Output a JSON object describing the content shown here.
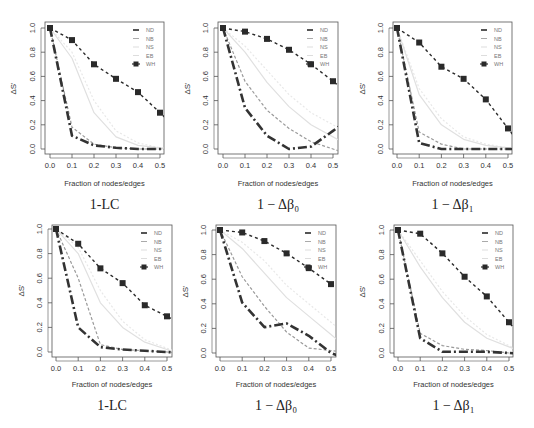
{
  "figure": {
    "legend_labels": [
      "ND",
      "NB",
      "NS",
      "EB",
      "WH"
    ],
    "xlabel": "Fraction of nodes/edges",
    "ylabel": "ΔS'",
    "x_ticks": [
      "0.0",
      "0.1",
      "0.2",
      "0.3",
      "0.4",
      "0.5"
    ],
    "y_ticks": [
      "0.0",
      "0.2",
      "0.4",
      "0.6",
      "0.8",
      "1.0"
    ],
    "colors": {
      "ND": "#333333",
      "NB": "#9a9a9a",
      "NS": "#e0e0e0",
      "EB": "#e8e8e8",
      "WH": "#2a2a2a",
      "axis": "#555555",
      "text": "#333333"
    }
  },
  "chart_data": [
    {
      "type": "line",
      "caption": "1-LC",
      "title": "",
      "xlabel": "Fraction of nodes/edges",
      "ylabel": "ΔS'",
      "x": [
        0.0,
        0.1,
        0.2,
        0.3,
        0.4,
        0.5
      ],
      "xlim": [
        0,
        0.52
      ],
      "ylim": [
        0,
        1.0
      ],
      "grid": false,
      "legend_position": "top-right",
      "series": [
        {
          "name": "ND",
          "values": [
            1.0,
            0.11,
            0.03,
            0.01,
            0.0,
            0.0
          ]
        },
        {
          "name": "NB",
          "values": [
            1.0,
            0.18,
            0.04,
            0.01,
            0.0,
            0.0
          ]
        },
        {
          "name": "NS",
          "values": [
            1.0,
            0.75,
            0.3,
            0.1,
            0.03,
            0.01
          ]
        },
        {
          "name": "EB",
          "values": [
            1.0,
            0.8,
            0.4,
            0.15,
            0.05,
            0.01
          ]
        },
        {
          "name": "WH",
          "values": [
            1.0,
            0.9,
            0.7,
            0.58,
            0.47,
            0.3
          ]
        }
      ]
    },
    {
      "type": "line",
      "caption": "1 − Δβ₀",
      "title": "",
      "xlabel": "Fraction of nodes/edges",
      "ylabel": "ΔS'",
      "x": [
        0.0,
        0.1,
        0.2,
        0.3,
        0.4,
        0.5
      ],
      "xlim": [
        0,
        0.52
      ],
      "ylim": [
        0,
        1.0
      ],
      "grid": false,
      "legend_position": "top-right",
      "series": [
        {
          "name": "ND",
          "values": [
            1.0,
            0.34,
            0.11,
            0.0,
            0.02,
            0.15
          ]
        },
        {
          "name": "NB",
          "values": [
            1.0,
            0.56,
            0.32,
            0.17,
            0.06,
            0.0
          ]
        },
        {
          "name": "NS",
          "values": [
            1.0,
            0.8,
            0.55,
            0.35,
            0.2,
            0.1
          ]
        },
        {
          "name": "EB",
          "values": [
            1.0,
            0.85,
            0.65,
            0.45,
            0.3,
            0.2
          ]
        },
        {
          "name": "WH",
          "values": [
            1.0,
            0.97,
            0.91,
            0.82,
            0.7,
            0.56
          ]
        }
      ]
    },
    {
      "type": "line",
      "caption": "1 − Δβ₁",
      "title": "",
      "xlabel": "Fraction of nodes/edges",
      "ylabel": "ΔS'",
      "x": [
        0.0,
        0.1,
        0.2,
        0.3,
        0.4,
        0.5
      ],
      "xlim": [
        0,
        0.52
      ],
      "ylim": [
        0,
        1.0
      ],
      "grid": false,
      "legend_position": "top-right",
      "series": [
        {
          "name": "ND",
          "values": [
            1.0,
            0.05,
            0.0,
            0.0,
            0.0,
            0.0
          ]
        },
        {
          "name": "NB",
          "values": [
            1.0,
            0.14,
            0.04,
            0.0,
            0.0,
            0.0
          ]
        },
        {
          "name": "NS",
          "values": [
            1.0,
            0.45,
            0.2,
            0.08,
            0.03,
            0.01
          ]
        },
        {
          "name": "EB",
          "values": [
            1.0,
            0.5,
            0.25,
            0.1,
            0.04,
            0.01
          ]
        },
        {
          "name": "WH",
          "values": [
            1.0,
            0.88,
            0.68,
            0.58,
            0.41,
            0.17
          ]
        }
      ]
    },
    {
      "type": "line",
      "caption": "1-LC",
      "title": "",
      "xlabel": "Fraction of nodes/edges",
      "ylabel": "ΔS'",
      "x": [
        0.0,
        0.1,
        0.2,
        0.3,
        0.4,
        0.5
      ],
      "xlim": [
        0,
        0.52
      ],
      "ylim": [
        0,
        1.0
      ],
      "grid": false,
      "legend_position": "top-right",
      "series": [
        {
          "name": "ND",
          "values": [
            1.0,
            0.2,
            0.04,
            0.02,
            0.01,
            0.0
          ]
        },
        {
          "name": "NB",
          "values": [
            1.0,
            0.6,
            0.06,
            0.02,
            0.01,
            0.0
          ]
        },
        {
          "name": "NS",
          "values": [
            1.0,
            0.8,
            0.4,
            0.2,
            0.08,
            0.02
          ]
        },
        {
          "name": "EB",
          "values": [
            1.0,
            0.85,
            0.5,
            0.25,
            0.1,
            0.03
          ]
        },
        {
          "name": "WH",
          "values": [
            1.0,
            0.88,
            0.68,
            0.56,
            0.38,
            0.29
          ]
        }
      ]
    },
    {
      "type": "line",
      "caption": "1 − Δβ₀",
      "title": "",
      "xlabel": "Fraction of nodes/edges",
      "ylabel": "ΔS'",
      "x": [
        0.0,
        0.1,
        0.2,
        0.3,
        0.4,
        0.5
      ],
      "xlim": [
        0,
        0.52
      ],
      "ylim": [
        0,
        1.0
      ],
      "grid": false,
      "legend_position": "top-right",
      "series": [
        {
          "name": "ND",
          "values": [
            1.0,
            0.41,
            0.21,
            0.24,
            0.14,
            0.0
          ]
        },
        {
          "name": "NB",
          "values": [
            1.0,
            0.62,
            0.38,
            0.17,
            0.04,
            0.02
          ]
        },
        {
          "name": "NS",
          "values": [
            1.0,
            0.85,
            0.65,
            0.45,
            0.3,
            0.15
          ]
        },
        {
          "name": "EB",
          "values": [
            1.0,
            0.9,
            0.75,
            0.55,
            0.4,
            0.25
          ]
        },
        {
          "name": "WH",
          "values": [
            1.0,
            0.98,
            0.91,
            0.81,
            0.69,
            0.56
          ]
        }
      ]
    },
    {
      "type": "line",
      "caption": "1 − Δβ₁",
      "title": "",
      "xlabel": "Fraction of nodes/edges",
      "ylabel": "ΔS'",
      "x": [
        0.0,
        0.1,
        0.2,
        0.3,
        0.4,
        0.5
      ],
      "xlim": [
        0,
        0.52
      ],
      "ylim": [
        0,
        1.0
      ],
      "grid": false,
      "legend_position": "top-right",
      "series": [
        {
          "name": "ND",
          "values": [
            1.0,
            0.12,
            0.01,
            0.01,
            0.01,
            0.0
          ]
        },
        {
          "name": "NB",
          "values": [
            1.0,
            0.16,
            0.06,
            0.03,
            0.02,
            0.0
          ]
        },
        {
          "name": "NS",
          "values": [
            1.0,
            0.7,
            0.45,
            0.25,
            0.12,
            0.05
          ]
        },
        {
          "name": "EB",
          "values": [
            1.0,
            0.75,
            0.5,
            0.3,
            0.15,
            0.06
          ]
        },
        {
          "name": "WH",
          "values": [
            1.0,
            0.97,
            0.81,
            0.62,
            0.46,
            0.25
          ]
        }
      ]
    }
  ],
  "layout": [
    {
      "box": [
        45,
        22,
        164,
        154
      ],
      "x0": 50,
      "x5": 160,
      "y1": 28,
      "y0": 149,
      "tick_y": 168,
      "xlabel_y": 186,
      "caption_y": 209,
      "ylabel_x": 16
    },
    {
      "box": [
        218,
        22,
        338,
        154
      ],
      "x0": 223,
      "x5": 333,
      "y1": 28,
      "y0": 149,
      "tick_y": 168,
      "xlabel_y": 186,
      "caption_y": 209,
      "ylabel_x": 190
    },
    {
      "box": [
        393,
        22,
        512,
        154
      ],
      "x0": 397,
      "x5": 508,
      "y1": 28,
      "y0": 149,
      "tick_y": 168,
      "xlabel_y": 186,
      "caption_y": 209,
      "ylabel_x": 365
    },
    {
      "box": [
        52,
        225,
        172,
        357
      ],
      "x0": 56,
      "x5": 167,
      "y1": 229,
      "y0": 352,
      "tick_y": 371,
      "xlabel_y": 387,
      "caption_y": 410,
      "ylabel_x": 24
    },
    {
      "box": [
        216,
        225,
        336,
        357
      ],
      "x0": 220,
      "x5": 331,
      "y1": 230,
      "y0": 353,
      "tick_y": 371,
      "xlabel_y": 387,
      "caption_y": 410,
      "ylabel_x": 188
    },
    {
      "box": [
        394,
        225,
        513,
        357
      ],
      "x0": 398,
      "x5": 509,
      "y1": 230,
      "y0": 353,
      "tick_y": 371,
      "xlabel_y": 387,
      "caption_y": 410,
      "ylabel_x": 365
    }
  ]
}
